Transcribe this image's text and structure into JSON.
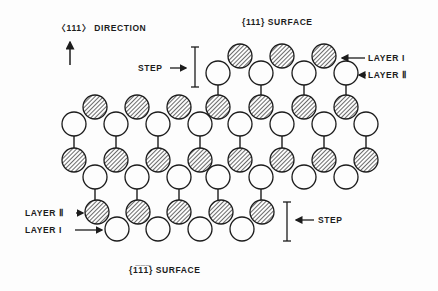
{
  "labels": {
    "direction": "〈111〉 DIRECTION",
    "top_surface": "{111} SURFACE",
    "bottom_surface": "{1̅1̅1̅} SURFACE",
    "step_top": "STEP",
    "step_bottom": "STEP",
    "layer_I_top": "LAYER I",
    "layer_II_top": "LAYER Ⅱ",
    "layer_II_bottom": "LAYER Ⅱ",
    "layer_I_bottom": "LAYER I"
  },
  "colors": {
    "ink": "#1c1c1c",
    "background": "#fdfdfd"
  },
  "atoms": {
    "radius": 12,
    "hatched_rows": [
      {
        "y": 56,
        "x": [
          240,
          282,
          324
        ]
      },
      {
        "y": 107,
        "x": [
          95,
          137,
          179,
          218,
          261,
          304,
          346
        ]
      },
      {
        "y": 160,
        "x": [
          74,
          116,
          158,
          200,
          240,
          282,
          324,
          366
        ]
      },
      {
        "y": 212,
        "x": [
          97,
          138,
          179,
          221,
          262
        ]
      }
    ],
    "open_rows": [
      {
        "y": 73,
        "x": [
          218,
          261,
          304,
          346
        ]
      },
      {
        "y": 124,
        "x": [
          74,
          116,
          158,
          200,
          240,
          282,
          324,
          366
        ]
      },
      {
        "y": 177,
        "x": [
          95,
          137,
          179,
          218,
          261,
          304,
          346
        ]
      },
      {
        "y": 229,
        "x": [
          117,
          158,
          200,
          242
        ]
      }
    ]
  }
}
